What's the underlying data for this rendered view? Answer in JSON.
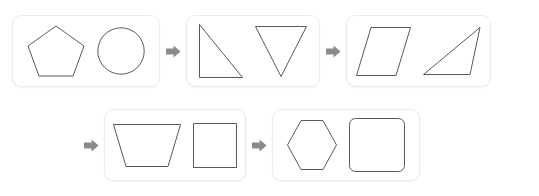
{
  "diagram": {
    "type": "flow-sequence",
    "background_color": "#ffffff",
    "card_border_color": "#ececec",
    "shape_stroke_color": "#595959",
    "arrow_color": "#8a8a8a",
    "arrow_icon_name": "right-arrow-icon",
    "arrow_glyph": "➡",
    "rows": [
      {
        "name": "top-row",
        "cards": [
          1,
          2,
          3
        ]
      },
      {
        "name": "bottom-row",
        "cards": [
          4,
          5
        ]
      }
    ],
    "steps": [
      {
        "index": 1,
        "label": "Step 1",
        "shapes": [
          {
            "name": "pentagon",
            "sides": 5,
            "label": "Pentagon"
          },
          {
            "name": "circle",
            "sides": 0,
            "label": "Circle"
          }
        ]
      },
      {
        "index": 2,
        "label": "Step 2",
        "shapes": [
          {
            "name": "right-triangle",
            "sides": 3,
            "label": "Right triangle"
          },
          {
            "name": "inverted-triangle",
            "sides": 3,
            "label": "Inverted triangle"
          }
        ]
      },
      {
        "index": 3,
        "label": "Step 3",
        "shapes": [
          {
            "name": "parallelogram",
            "sides": 4,
            "label": "Parallelogram"
          },
          {
            "name": "scalene-triangle",
            "sides": 3,
            "label": "Scalene triangle"
          }
        ]
      },
      {
        "index": 4,
        "label": "Step 4",
        "shapes": [
          {
            "name": "trapezoid",
            "sides": 4,
            "label": "Trapezoid"
          },
          {
            "name": "square",
            "sides": 4,
            "label": "Square"
          }
        ]
      },
      {
        "index": 5,
        "label": "Step 5",
        "shapes": [
          {
            "name": "hexagon",
            "sides": 6,
            "label": "Hexagon"
          },
          {
            "name": "rounded-square",
            "sides": 4,
            "label": "Rounded square"
          }
        ]
      }
    ],
    "connectors": [
      {
        "name": "arrow-1-to-2",
        "from": 1,
        "to": 2
      },
      {
        "name": "arrow-2-to-3",
        "from": 2,
        "to": 3
      },
      {
        "name": "arrow-3-to-4",
        "from": 3,
        "to": 4
      },
      {
        "name": "arrow-4-to-5",
        "from": 4,
        "to": 5
      }
    ]
  }
}
